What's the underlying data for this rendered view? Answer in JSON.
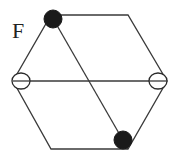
{
  "figure": {
    "label": "F",
    "colors": {
      "background": "#ffffff",
      "stroke": "#3a3a3a",
      "filled_node": "#1a1a1a",
      "open_node": "#ffffff"
    },
    "hexagon": {
      "vertices": {
        "top_left": [
          51,
          15
        ],
        "top_right": [
          128,
          15
        ],
        "right": [
          167,
          81
        ],
        "bottom_right": [
          128,
          149
        ],
        "bottom_left": [
          51,
          149
        ],
        "left": [
          13,
          81
        ]
      }
    },
    "inner_lines": [
      {
        "name": "horizontal-diagonal",
        "from": "left",
        "to": "right"
      },
      {
        "name": "slanted-diagonal",
        "from": "top_left",
        "to": "bottom_right"
      }
    ],
    "nodes": [
      {
        "name": "top-left-filled-node",
        "type": "filled",
        "center": [
          53,
          19
        ],
        "radius": 9
      },
      {
        "name": "bottom-right-filled-node",
        "type": "filled",
        "center": [
          123,
          140
        ],
        "radius": 9
      },
      {
        "name": "left-open-node",
        "type": "open",
        "center": [
          21,
          81
        ],
        "rx": 9,
        "ry": 8
      },
      {
        "name": "right-open-node",
        "type": "open",
        "center": [
          158,
          81
        ],
        "rx": 9,
        "ry": 8
      }
    ]
  }
}
